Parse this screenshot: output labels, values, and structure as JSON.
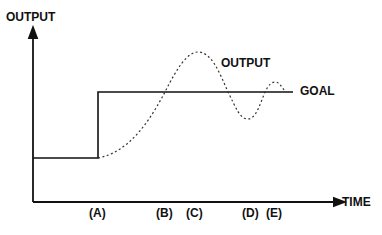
{
  "diagram": {
    "y_axis_label": "OUTPUT",
    "x_axis_label": "TIME",
    "curve_label": "OUTPUT",
    "goal_label": "GOAL",
    "time_markers": [
      "(A)",
      "(B)",
      "(C)",
      "(D)",
      "(E)"
    ],
    "colors": {
      "line": "#111111",
      "curve": "#333333",
      "background": "#ffffff"
    }
  }
}
